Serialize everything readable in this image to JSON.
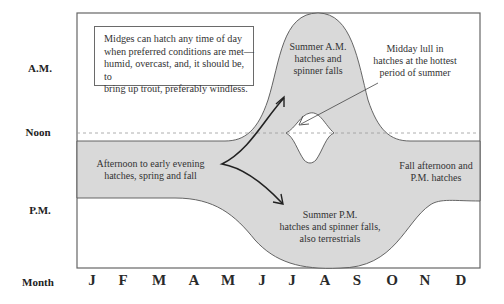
{
  "y_axis": {
    "am": "A.M.",
    "noon": "Noon",
    "pm": "P.M."
  },
  "x_axis": {
    "title": "Month",
    "months": [
      "J",
      "F",
      "M",
      "A",
      "M",
      "J",
      "J",
      "A",
      "S",
      "O",
      "N",
      "D"
    ]
  },
  "note_box": {
    "line1": "Midges can hatch any time of day",
    "line2": "when preferred conditions are met—",
    "line3": "humid, overcast, and, it should be, to",
    "line4": "bring up trout, preferably windless."
  },
  "regions": {
    "spring_fall": {
      "line1": "Afternoon to early evening",
      "line2": "hatches, spring and fall"
    },
    "summer_am": {
      "line1": "Summer A.M.",
      "line2": "hatches and",
      "line3": "spinner falls"
    },
    "midday_lull": {
      "line1": "Midday lull in",
      "line2": "hatches at the hottest",
      "line3": "period of summer"
    },
    "fall_pm": {
      "line1": "Fall afternoon and",
      "line2": "P.M. hatches"
    },
    "summer_pm": {
      "line1": "Summer P.M.",
      "line2": "hatches and spinner falls,",
      "line3": "also terrestrials"
    }
  },
  "colors": {
    "shade": "#d9d9d9",
    "outline": "#555555",
    "frame": "#666666",
    "dash": "#9a9a9a",
    "arrow": "#222222"
  }
}
